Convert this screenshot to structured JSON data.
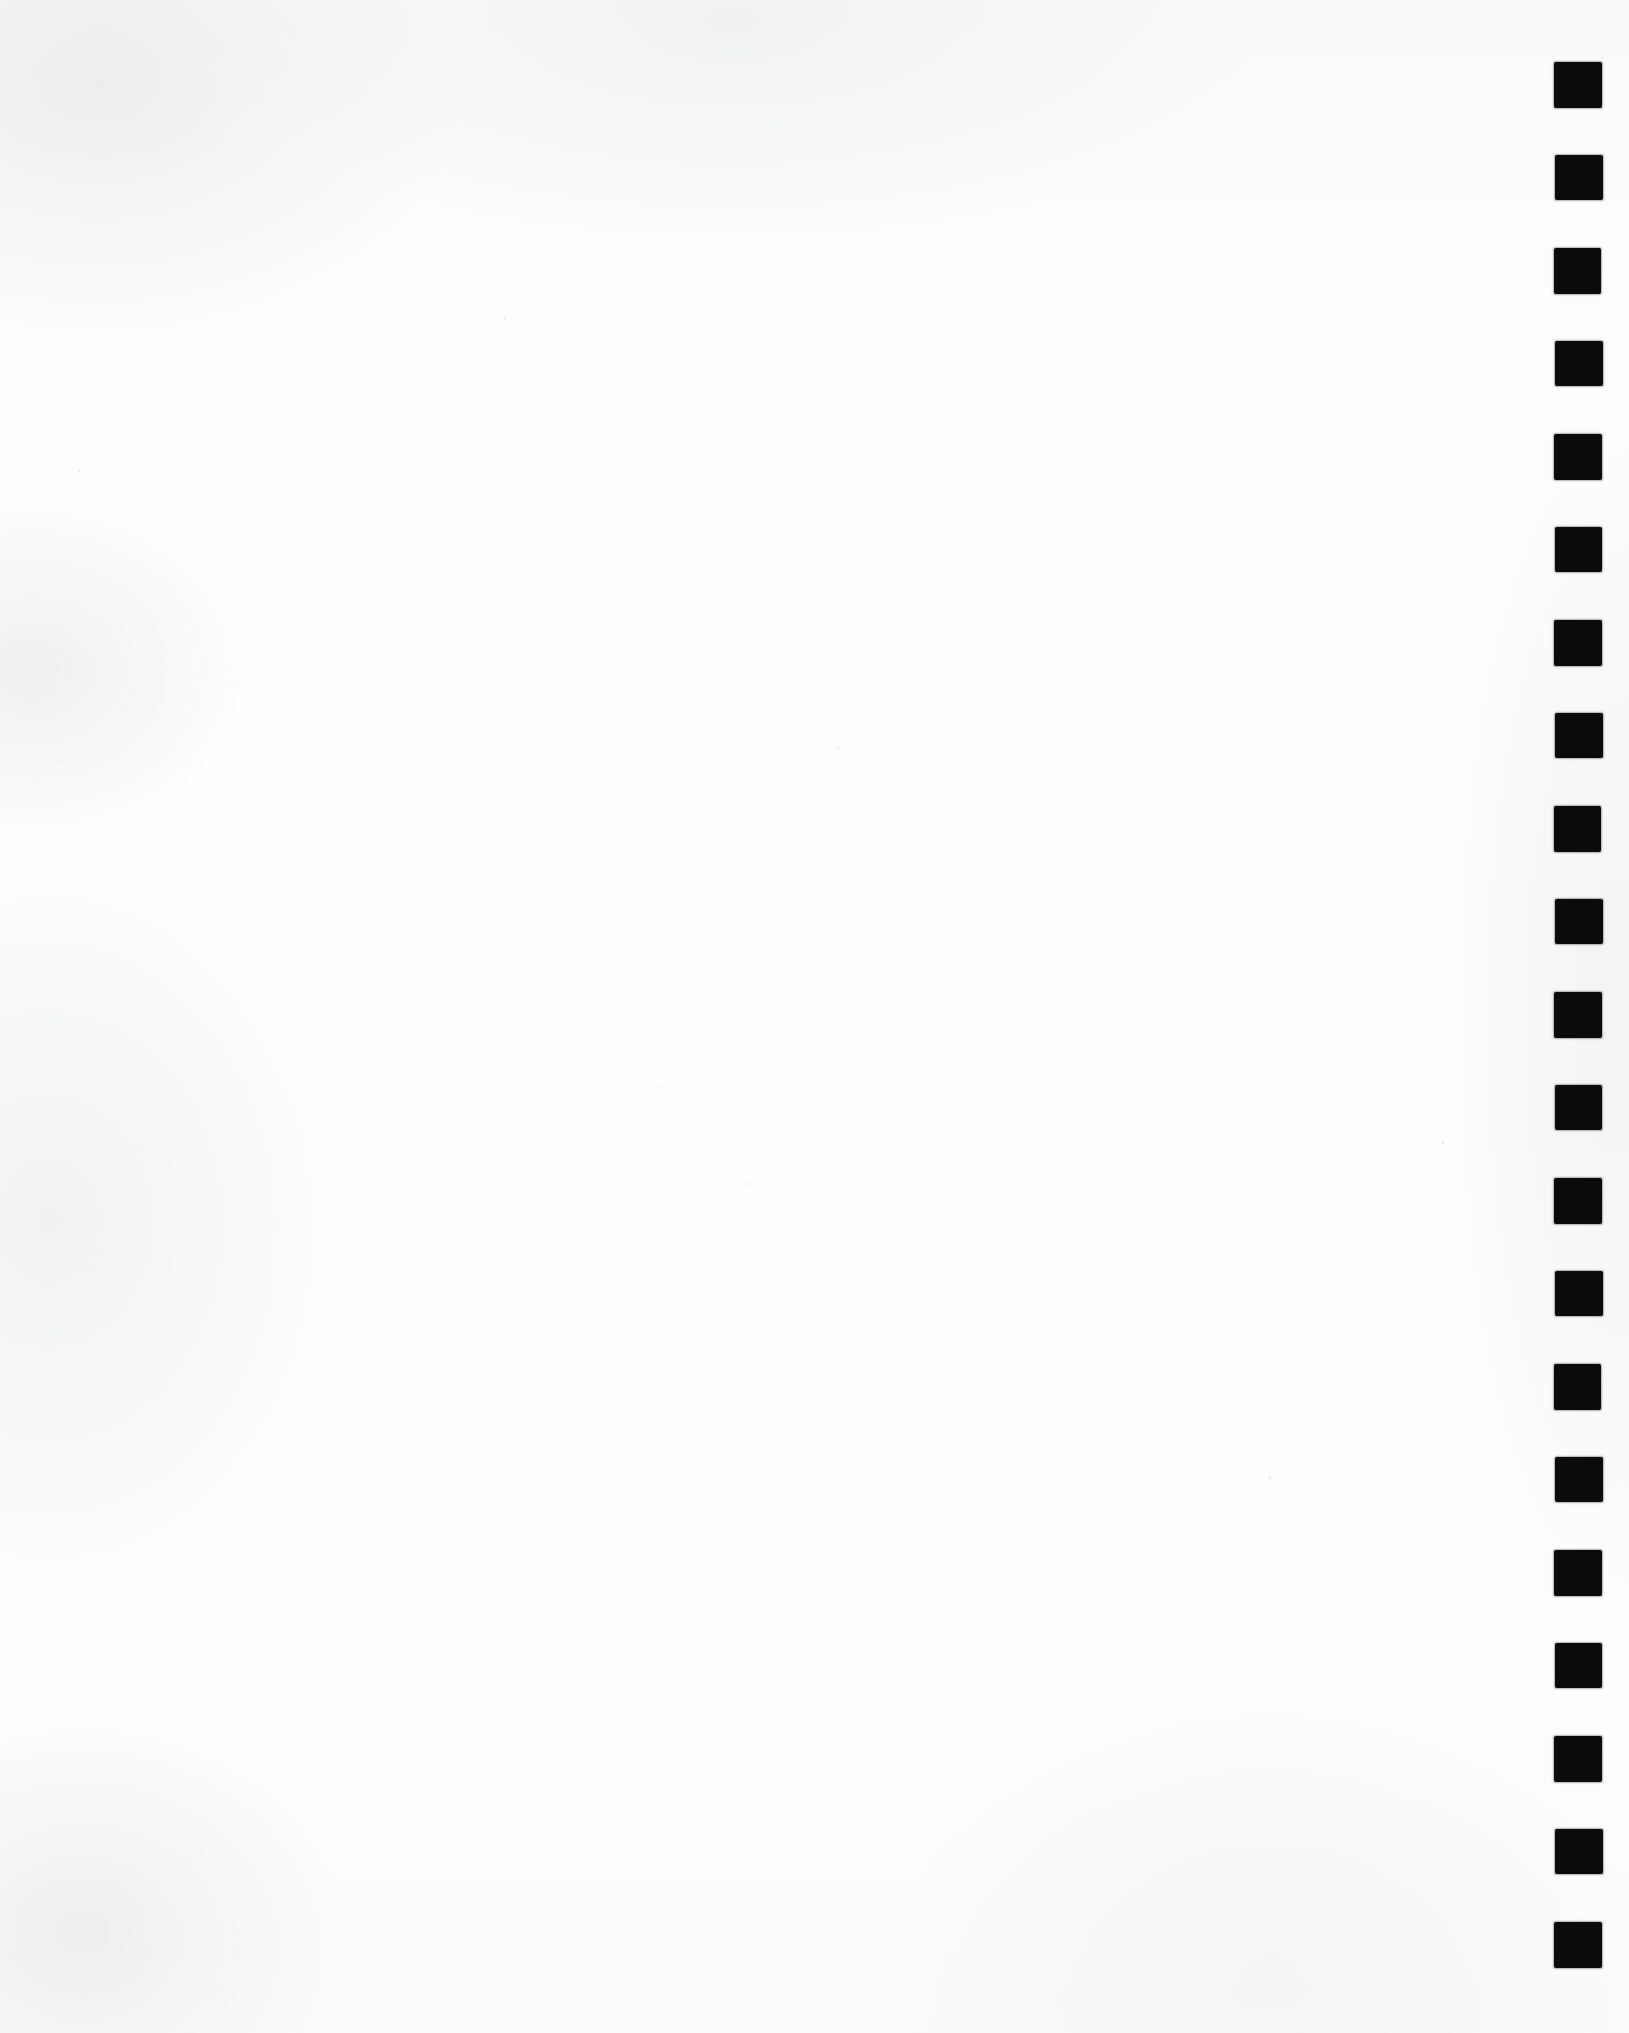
{
  "document": {
    "kind": "scanned-page",
    "content_text": "",
    "page_width": 1629,
    "page_height": 2033,
    "paper_color": "#fcfcfc",
    "background_color": "#ffffff",
    "description": "Blank scanned sheet with a vertical strip of solid black registration squares down the right margin"
  },
  "registration_strip": {
    "name": "registration-mark-strip",
    "mark_color": "#0b0b0b",
    "mark_count": 21,
    "mark_width": 48,
    "mark_height": 46,
    "left": 1554,
    "first_top": 62,
    "spacing": 93,
    "marks": [
      {
        "index": 1,
        "left": 1554,
        "top": 62,
        "width": 48,
        "height": 46
      },
      {
        "index": 2,
        "left": 1555,
        "top": 155,
        "width": 48,
        "height": 45
      },
      {
        "index": 3,
        "left": 1554,
        "top": 248,
        "width": 47,
        "height": 46
      },
      {
        "index": 4,
        "left": 1555,
        "top": 341,
        "width": 48,
        "height": 45
      },
      {
        "index": 5,
        "left": 1554,
        "top": 434,
        "width": 48,
        "height": 46
      },
      {
        "index": 6,
        "left": 1555,
        "top": 527,
        "width": 47,
        "height": 45
      },
      {
        "index": 7,
        "left": 1554,
        "top": 620,
        "width": 48,
        "height": 46
      },
      {
        "index": 8,
        "left": 1555,
        "top": 713,
        "width": 48,
        "height": 45
      },
      {
        "index": 9,
        "left": 1554,
        "top": 806,
        "width": 47,
        "height": 46
      },
      {
        "index": 10,
        "left": 1555,
        "top": 899,
        "width": 48,
        "height": 45
      },
      {
        "index": 11,
        "left": 1554,
        "top": 992,
        "width": 48,
        "height": 46
      },
      {
        "index": 12,
        "left": 1555,
        "top": 1085,
        "width": 47,
        "height": 45
      },
      {
        "index": 13,
        "left": 1554,
        "top": 1178,
        "width": 48,
        "height": 46
      },
      {
        "index": 14,
        "left": 1555,
        "top": 1271,
        "width": 48,
        "height": 45
      },
      {
        "index": 15,
        "left": 1554,
        "top": 1364,
        "width": 47,
        "height": 46
      },
      {
        "index": 16,
        "left": 1555,
        "top": 1457,
        "width": 48,
        "height": 45
      },
      {
        "index": 17,
        "left": 1554,
        "top": 1550,
        "width": 48,
        "height": 46
      },
      {
        "index": 18,
        "left": 1555,
        "top": 1643,
        "width": 47,
        "height": 45
      },
      {
        "index": 19,
        "left": 1554,
        "top": 1736,
        "width": 48,
        "height": 46
      },
      {
        "index": 20,
        "left": 1555,
        "top": 1829,
        "width": 48,
        "height": 45
      },
      {
        "index": 21,
        "left": 1554,
        "top": 1922,
        "width": 48,
        "height": 46
      }
    ]
  }
}
